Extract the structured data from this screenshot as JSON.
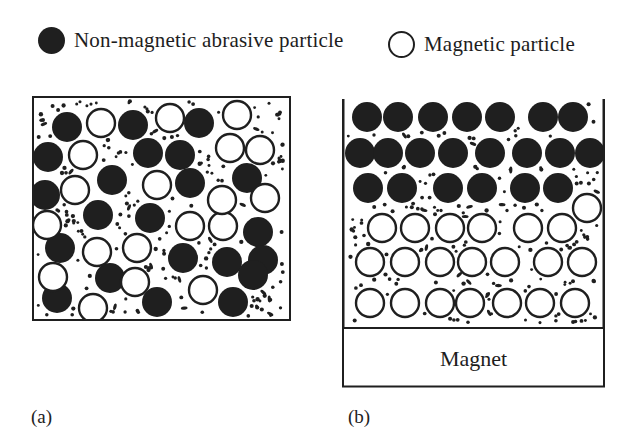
{
  "colors": {
    "ink": "#1f1f1f",
    "background": "#ffffff"
  },
  "legend": {
    "items": [
      {
        "marker": "filled-circle",
        "label": "Non-magnetic abrasive particle"
      },
      {
        "marker": "open-circle",
        "label": "Magnetic particle"
      }
    ]
  },
  "panels": {
    "a": {
      "caption": "(a)",
      "box": {
        "left": 32,
        "top": 96,
        "width": 259,
        "height": 225
      },
      "particle_radius": 15,
      "open_particle_radius": 14,
      "dark_particles": [
        [
          35,
          31
        ],
        [
          101,
          29
        ],
        [
          167,
          27
        ],
        [
          16,
          61
        ],
        [
          116,
          57
        ],
        [
          148,
          59
        ],
        [
          80,
          84
        ],
        [
          158,
          87
        ],
        [
          215,
          82
        ],
        [
          13,
          99
        ],
        [
          66,
          119
        ],
        [
          118,
          122
        ],
        [
          226,
          136
        ],
        [
          28,
          152
        ],
        [
          151,
          162
        ],
        [
          195,
          166
        ],
        [
          231,
          164
        ],
        [
          78,
          182
        ],
        [
          25,
          202
        ],
        [
          125,
          206
        ],
        [
          201,
          206
        ],
        [
          221,
          179
        ]
      ],
      "open_particles": [
        [
          69,
          27
        ],
        [
          138,
          22
        ],
        [
          205,
          19
        ],
        [
          51,
          59
        ],
        [
          198,
          52
        ],
        [
          228,
          54
        ],
        [
          43,
          94
        ],
        [
          125,
          89
        ],
        [
          233,
          102
        ],
        [
          15,
          129
        ],
        [
          158,
          130
        ],
        [
          191,
          130
        ],
        [
          190,
          104
        ],
        [
          65,
          156
        ],
        [
          105,
          152
        ],
        [
          21,
          181
        ],
        [
          103,
          186
        ],
        [
          171,
          194
        ],
        [
          61,
          212
        ]
      ],
      "dots": {
        "count": 170,
        "seed": 7
      }
    },
    "b": {
      "caption": "(b)",
      "box": {
        "left": 342,
        "top": 98,
        "width": 263,
        "height": 230
      },
      "particle_radius": 15,
      "open_particle_radius": 14,
      "magnet": {
        "label": "Magnet",
        "height": 60
      },
      "dark_particles": [
        [
          25,
          19
        ],
        [
          56,
          19
        ],
        [
          91,
          19
        ],
        [
          125,
          19
        ],
        [
          158,
          19
        ],
        [
          201,
          19
        ],
        [
          231,
          19
        ],
        [
          18,
          55
        ],
        [
          46,
          55
        ],
        [
          78,
          55
        ],
        [
          111,
          55
        ],
        [
          148,
          55
        ],
        [
          185,
          55
        ],
        [
          218,
          55
        ],
        [
          248,
          55
        ],
        [
          26,
          90
        ],
        [
          60,
          90
        ],
        [
          106,
          90
        ],
        [
          140,
          90
        ],
        [
          183,
          90
        ],
        [
          216,
          90
        ]
      ],
      "open_particles": [
        [
          245,
          110
        ],
        [
          40,
          130
        ],
        [
          73,
          130
        ],
        [
          108,
          130
        ],
        [
          140,
          130
        ],
        [
          186,
          130
        ],
        [
          220,
          130
        ],
        [
          28,
          164
        ],
        [
          63,
          164
        ],
        [
          98,
          164
        ],
        [
          130,
          164
        ],
        [
          163,
          164
        ],
        [
          206,
          164
        ],
        [
          240,
          164
        ],
        [
          28,
          205
        ],
        [
          63,
          205
        ],
        [
          98,
          205
        ],
        [
          128,
          205
        ],
        [
          165,
          205
        ],
        [
          198,
          205
        ],
        [
          233,
          205
        ]
      ],
      "dots": {
        "count": 155,
        "seed": 13
      }
    }
  }
}
